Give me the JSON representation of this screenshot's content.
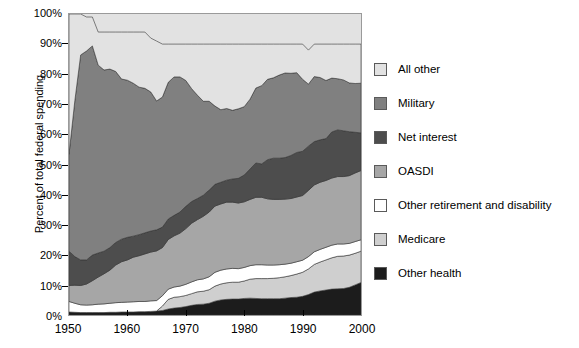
{
  "chart_data": {
    "type": "area",
    "title": "",
    "subtitle": "",
    "xlabel": "",
    "ylabel": "Percent of total federal spending",
    "xlim": [
      1950,
      2000
    ],
    "ylim": [
      0,
      100
    ],
    "grid": false,
    "stacked": true,
    "legend_position": "right",
    "xticks": [
      "1950",
      "1960",
      "1970",
      "1980",
      "1990",
      "2000"
    ],
    "xtick_values": [
      1950,
      1960,
      1970,
      1980,
      1990,
      2000
    ],
    "yticks": [
      "0%",
      "10%",
      "20%",
      "30%",
      "40%",
      "50%",
      "60%",
      "70%",
      "80%",
      "90%",
      "100%"
    ],
    "ytick_values": [
      0,
      10,
      20,
      30,
      40,
      50,
      60,
      70,
      80,
      90,
      100
    ],
    "x": [
      1950,
      1951,
      1952,
      1953,
      1954,
      1955,
      1956,
      1957,
      1958,
      1959,
      1960,
      1961,
      1962,
      1963,
      1964,
      1965,
      1966,
      1967,
      1968,
      1969,
      1970,
      1971,
      1972,
      1973,
      1974,
      1975,
      1976,
      1977,
      1978,
      1979,
      1980,
      1981,
      1982,
      1983,
      1984,
      1985,
      1986,
      1987,
      1988,
      1989,
      1990,
      1991,
      1992,
      1993,
      1994,
      1995,
      1996,
      1997,
      1998,
      1999,
      2000
    ],
    "series": [
      {
        "name": "Other health",
        "color": "#1c1c1c",
        "values": [
          1.0,
          0.9,
          0.8,
          0.8,
          0.8,
          0.8,
          0.8,
          0.9,
          0.9,
          1.0,
          1.0,
          1.0,
          1.1,
          1.1,
          1.2,
          1.3,
          1.5,
          2.0,
          2.3,
          2.5,
          2.8,
          3.2,
          3.5,
          3.6,
          3.9,
          4.6,
          5.0,
          5.2,
          5.3,
          5.3,
          5.5,
          5.6,
          5.5,
          5.4,
          5.4,
          5.4,
          5.4,
          5.6,
          5.8,
          5.9,
          6.2,
          6.8,
          7.6,
          8.0,
          8.3,
          8.6,
          8.7,
          8.8,
          9.2,
          10.0,
          10.8
        ]
      },
      {
        "name": "Medicare",
        "color": "#cfcfcf",
        "values": [
          0,
          0,
          0,
          0,
          0,
          0,
          0,
          0,
          0,
          0,
          0,
          0,
          0,
          0,
          0,
          0,
          1.5,
          3.2,
          3.6,
          3.6,
          3.7,
          3.9,
          4.2,
          4.3,
          4.5,
          5.0,
          5.3,
          5.5,
          5.6,
          5.6,
          5.8,
          6.3,
          6.6,
          6.7,
          6.7,
          6.8,
          7.0,
          7.1,
          7.3,
          7.7,
          8.0,
          8.5,
          9.2,
          9.6,
          10.0,
          10.4,
          10.8,
          10.8,
          10.7,
          10.5,
          10.4
        ]
      },
      {
        "name": "Other retirement and disability",
        "color": "#ffffff",
        "values": [
          3.5,
          3.0,
          2.6,
          2.5,
          2.6,
          2.8,
          2.9,
          3.0,
          3.2,
          3.2,
          3.3,
          3.4,
          3.4,
          3.4,
          3.5,
          3.5,
          3.4,
          3.4,
          3.4,
          3.5,
          3.7,
          3.9,
          4.0,
          4.1,
          4.3,
          4.6,
          4.6,
          4.6,
          4.6,
          4.5,
          4.5,
          4.5,
          4.6,
          4.6,
          4.5,
          4.4,
          4.3,
          4.2,
          4.1,
          4.1,
          4.0,
          4.1,
          4.2,
          4.2,
          4.2,
          4.2,
          4.1,
          4.0,
          3.9,
          3.9,
          3.8
        ]
      },
      {
        "name": "OASDI",
        "color": "#a6a6a6",
        "values": [
          5.3,
          6.0,
          6.4,
          7.0,
          8.0,
          9.0,
          10.0,
          11.0,
          12.5,
          13.5,
          14.0,
          14.8,
          15.2,
          15.8,
          16.2,
          16.5,
          16.0,
          16.5,
          17.0,
          17.6,
          18.5,
          19.5,
          20.0,
          20.8,
          21.5,
          22.0,
          22.0,
          22.2,
          22.0,
          21.8,
          21.8,
          22.0,
          22.4,
          22.4,
          22.0,
          21.8,
          21.7,
          21.6,
          21.5,
          21.5,
          21.5,
          22.0,
          22.2,
          22.3,
          22.2,
          22.3,
          22.4,
          22.4,
          22.5,
          22.8,
          23.0
        ]
      },
      {
        "name": "Net interest",
        "color": "#4d4d4d",
        "values": [
          11.4,
          9.5,
          8.5,
          8.0,
          8.5,
          8.0,
          7.5,
          7.5,
          7.5,
          7.5,
          7.5,
          7.0,
          7.0,
          7.0,
          7.0,
          7.0,
          6.8,
          6.8,
          6.8,
          7.0,
          7.4,
          7.2,
          7.0,
          7.0,
          7.3,
          7.2,
          7.2,
          7.3,
          7.7,
          8.2,
          8.9,
          10.1,
          11.4,
          11.1,
          13.0,
          13.7,
          13.7,
          13.8,
          14.3,
          14.8,
          14.7,
          14.7,
          14.4,
          14.1,
          13.9,
          15.3,
          15.5,
          15.2,
          14.6,
          13.5,
          12.5
        ]
      },
      {
        "name": "Military",
        "color": "#808080",
        "values": [
          32.2,
          51.8,
          68.1,
          69.4,
          69.5,
          62.4,
          60.2,
          59.3,
          56.8,
          53.2,
          52.2,
          50.8,
          49.0,
          48.0,
          46.2,
          42.8,
          43.2,
          45.4,
          46.0,
          44.9,
          41.8,
          37.5,
          34.3,
          31.2,
          29.5,
          26.0,
          24.1,
          23.8,
          22.8,
          23.1,
          22.7,
          23.2,
          24.9,
          26.0,
          26.7,
          26.7,
          27.6,
          28.1,
          27.3,
          26.5,
          23.9,
          20.6,
          21.6,
          20.7,
          19.3,
          17.9,
          17.0,
          16.9,
          16.2,
          16.2,
          16.5
        ]
      },
      {
        "name": "All other",
        "color": "#e2e2e2",
        "values": [
          46.6,
          28.8,
          13.6,
          11.3,
          9.6,
          11.0,
          12.6,
          12.3,
          13.1,
          15.6,
          16.0,
          17.0,
          18.3,
          18.7,
          17.9,
          19.9,
          17.6,
          12.7,
          10.9,
          10.9,
          12.1,
          14.8,
          17.0,
          19.0,
          19.0,
          20.6,
          21.8,
          21.4,
          22.0,
          21.5,
          20.8,
          18.3,
          14.6,
          13.8,
          11.7,
          11.2,
          10.3,
          9.6,
          9.7,
          9.5,
          11.7,
          11.3,
          10.8,
          11.1,
          12.1,
          11.3,
          11.5,
          11.9,
          12.9,
          13.1,
          13.0
        ]
      }
    ]
  },
  "legend": {
    "items": [
      {
        "label": "All other",
        "color": "#e2e2e2"
      },
      {
        "label": "Military",
        "color": "#808080"
      },
      {
        "label": "Net interest",
        "color": "#4d4d4d"
      },
      {
        "label": "OASDI",
        "color": "#a6a6a6"
      },
      {
        "label": "Other retirement and disability",
        "color": "#ffffff"
      },
      {
        "label": "Medicare",
        "color": "#cfcfcf"
      },
      {
        "label": "Other health",
        "color": "#1c1c1c"
      }
    ]
  },
  "axes": {
    "y_title": "Percent of total federal spending"
  }
}
